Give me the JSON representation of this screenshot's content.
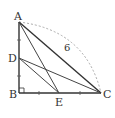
{
  "diagram": {
    "type": "geometry",
    "points": {
      "A": {
        "label": "A",
        "x": 19,
        "y": 22
      },
      "B": {
        "label": "B",
        "x": 19,
        "y": 93
      },
      "C": {
        "label": "C",
        "x": 101,
        "y": 93
      },
      "D": {
        "label": "D",
        "x": 19,
        "y": 58
      },
      "E": {
        "label": "E",
        "x": 59,
        "y": 93
      }
    },
    "segments": [
      "AB",
      "BC",
      "AC",
      "AE",
      "DC",
      "DE"
    ],
    "right_angle_at": "B",
    "arc_label": "6",
    "tick_marks": {
      "AB": "equal segments AD = DB marked with ticks",
      "BC": "equal segments BE = EC marked with ticks"
    },
    "colors": {
      "line": "#333333",
      "dashed_arc": "#aaaaaa",
      "label": "#333333"
    }
  }
}
